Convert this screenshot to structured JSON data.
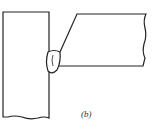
{
  "diagram": {
    "caption": "(b)",
    "colors": {
      "stroke": "#222222",
      "background": "#ffffff"
    },
    "parts": [
      "vertical-plate",
      "beveled-horizontal-plate",
      "weld-bead"
    ]
  }
}
